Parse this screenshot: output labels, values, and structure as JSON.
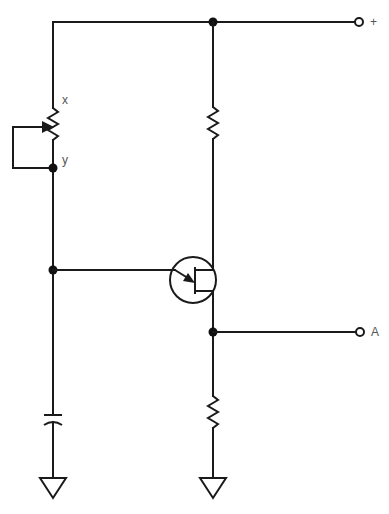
{
  "diagram": {
    "type": "circuit-schematic",
    "labels": {
      "pot_top": "x",
      "pot_bottom": "y",
      "supply_terminal": "+",
      "output_terminal": "A"
    },
    "components": [
      {
        "id": "potentiometer",
        "kind": "variable-resistor",
        "terminals": [
          "x",
          "y"
        ],
        "wiper": "shorted-to-y"
      },
      {
        "id": "capacitor",
        "kind": "capacitor"
      },
      {
        "id": "transistor",
        "kind": "transistor"
      },
      {
        "id": "resistor-top",
        "kind": "resistor"
      },
      {
        "id": "resistor-bottom",
        "kind": "resistor"
      },
      {
        "id": "ground-left",
        "kind": "ground"
      },
      {
        "id": "ground-right",
        "kind": "ground"
      }
    ],
    "colors": {
      "line": "#1a1a1a",
      "label": "#555555",
      "background": "#ffffff"
    }
  }
}
